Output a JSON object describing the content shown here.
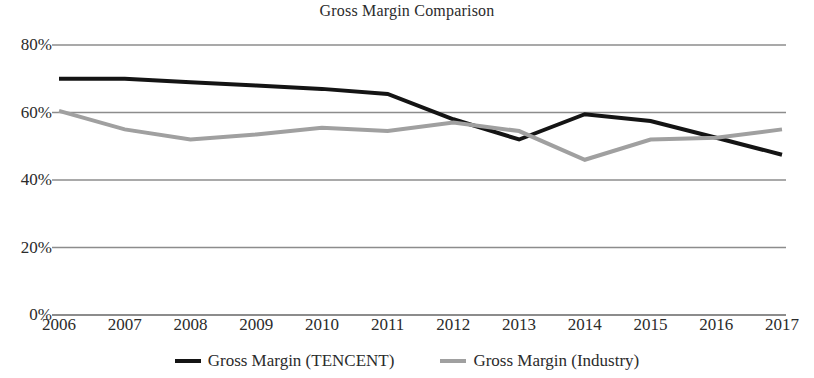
{
  "chart_data": {
    "type": "line",
    "title": "Gross Margin Comparison",
    "xlabel": "",
    "ylabel": "",
    "categories": [
      "2006",
      "2007",
      "2008",
      "2009",
      "2010",
      "2011",
      "2012",
      "2013",
      "2014",
      "2015",
      "2016",
      "2017"
    ],
    "x": [
      2006,
      2007,
      2008,
      2009,
      2010,
      2011,
      2012,
      2013,
      2014,
      2015,
      2016,
      2017
    ],
    "series": [
      {
        "name": "Gross Margin (TENCENT)",
        "color": "#141414",
        "width": 4,
        "values": [
          70,
          70,
          69,
          68,
          67,
          65.5,
          58,
          52,
          59.5,
          57.5,
          52.5,
          47.5
        ]
      },
      {
        "name": "Gross Margin (Industry)",
        "color": "#a0a0a0",
        "width": 4,
        "values": [
          60.5,
          55,
          52,
          53.5,
          55.5,
          54.5,
          57,
          54.5,
          46,
          52,
          52.5,
          55
        ]
      }
    ],
    "ylim": [
      0,
      80
    ],
    "yticks": [
      0,
      20,
      40,
      60,
      80
    ],
    "ytick_labels": [
      "0%",
      "20%",
      "40%",
      "60%",
      "80%"
    ],
    "grid": true,
    "grid_color": "#8c8c8c",
    "legend_position": "bottom",
    "background": "#ffffff"
  },
  "legend": {
    "items": [
      {
        "label": "Gross Margin (TENCENT)",
        "color": "#141414"
      },
      {
        "label": "Gross Margin (Industry)",
        "color": "#a0a0a0"
      }
    ]
  }
}
